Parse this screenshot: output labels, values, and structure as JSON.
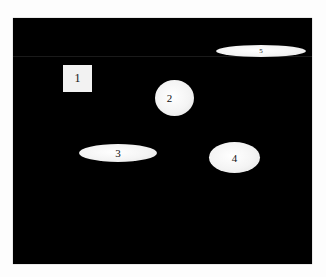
{
  "canvas": {
    "background": "#000000"
  },
  "shapes": [
    {
      "id": "1",
      "label": "1",
      "type": "square"
    },
    {
      "id": "2",
      "label": "2",
      "type": "circle"
    },
    {
      "id": "3",
      "label": "3",
      "type": "ellipse"
    },
    {
      "id": "4",
      "label": "4",
      "type": "ellipse"
    },
    {
      "id": "5",
      "label": "5",
      "type": "ellipse"
    }
  ]
}
